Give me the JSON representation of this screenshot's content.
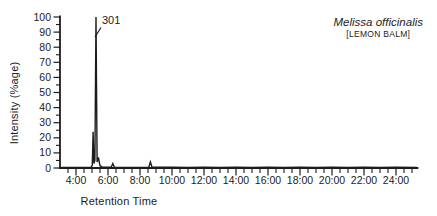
{
  "figure": {
    "title_latin": "Melissa officinalis",
    "title_common": "[LEMON BALM]",
    "peak_label": "301",
    "ink_color": "#1c1c1c",
    "background": "#ffffff"
  },
  "chart_data": {
    "type": "line",
    "xlabel": "Retention Time",
    "ylabel": "Intensity (%age)",
    "x_unit": "minutes (mm:ss)",
    "xlim": [
      3.0,
      25.4
    ],
    "ylim": [
      0,
      100
    ],
    "grid": false,
    "legend": false,
    "x_major_ticks": [
      4,
      6,
      8,
      10,
      12,
      14,
      16,
      18,
      20,
      22,
      24
    ],
    "x_major_tick_labels": [
      "4:00",
      "6:00",
      "8:00",
      "10:00",
      "12:00",
      "14:00",
      "16:00",
      "18:00",
      "20:00",
      "22:00",
      "24:00"
    ],
    "x_minor_tick_interval": 0.5,
    "y_major_ticks": [
      0,
      10,
      20,
      30,
      40,
      50,
      60,
      70,
      80,
      90,
      100
    ],
    "y_major_tick_labels": [
      "0",
      "10",
      "20",
      "30",
      "40",
      "50",
      "60",
      "70",
      "80",
      "90",
      "100"
    ],
    "y_minor_tick_interval": 5,
    "annotations": [
      {
        "text": "301",
        "x": 5.25,
        "y": 100
      }
    ],
    "series": [
      {
        "name": "chromatogram-trace",
        "points": [
          [
            3.1,
            0.4
          ],
          [
            4.6,
            0.4
          ],
          [
            4.95,
            0.6
          ],
          [
            5.02,
            2
          ],
          [
            5.07,
            24
          ],
          [
            5.12,
            3
          ],
          [
            5.18,
            5
          ],
          [
            5.25,
            100
          ],
          [
            5.32,
            4
          ],
          [
            5.4,
            7
          ],
          [
            5.5,
            1.5
          ],
          [
            5.65,
            0.6
          ],
          [
            6.2,
            0.5
          ],
          [
            6.3,
            3
          ],
          [
            6.4,
            0.5
          ],
          [
            7.5,
            0.4
          ],
          [
            8.55,
            0.5
          ],
          [
            8.65,
            4
          ],
          [
            8.75,
            0.5
          ],
          [
            10,
            0.5
          ],
          [
            11,
            0.3
          ],
          [
            12,
            0.5
          ],
          [
            13,
            0.4
          ],
          [
            14,
            0.5
          ],
          [
            15,
            0.3
          ],
          [
            16,
            0.5
          ],
          [
            17,
            0.4
          ],
          [
            18,
            0.5
          ],
          [
            19,
            0.3
          ],
          [
            20,
            0.5
          ],
          [
            21,
            0.4
          ],
          [
            22,
            0.5
          ],
          [
            23,
            0.3
          ],
          [
            24,
            0.5
          ],
          [
            25.3,
            0.4
          ]
        ]
      }
    ]
  }
}
